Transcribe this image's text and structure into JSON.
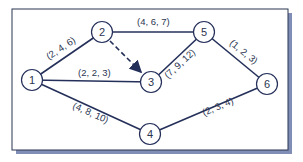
{
  "colors": {
    "line": "#25305a",
    "text": "#2a3550",
    "frame": "#2a3550",
    "shadow": "#6a7aa8",
    "node_fill": "#ffffff"
  },
  "nodes": [
    {
      "id": "1",
      "label": "1",
      "x": 32,
      "y": 80
    },
    {
      "id": "2",
      "label": "2",
      "x": 102,
      "y": 32
    },
    {
      "id": "3",
      "label": "3",
      "x": 151,
      "y": 82
    },
    {
      "id": "4",
      "label": "4",
      "x": 150,
      "y": 134
    },
    {
      "id": "5",
      "label": "5",
      "x": 204,
      "y": 32
    },
    {
      "id": "6",
      "label": "6",
      "x": 267,
      "y": 84
    }
  ],
  "edges": [
    {
      "from": "1",
      "to": "2",
      "label": "(2, 4, 6)",
      "dashed": false
    },
    {
      "from": "1",
      "to": "3",
      "label": "(2, 2, 3)",
      "dashed": false
    },
    {
      "from": "1",
      "to": "4",
      "label": "(4, 8, 10)",
      "dashed": false
    },
    {
      "from": "2",
      "to": "5",
      "label": "(4, 6, 7)",
      "dashed": false
    },
    {
      "from": "2",
      "to": "3",
      "label": "",
      "dashed": true
    },
    {
      "from": "3",
      "to": "5",
      "label": "(7, 9, 12)",
      "dashed": false
    },
    {
      "from": "5",
      "to": "6",
      "label": "(1, 2, 3)",
      "dashed": false
    },
    {
      "from": "4",
      "to": "6",
      "label": "(2, 3, 4)",
      "dashed": false
    }
  ]
}
